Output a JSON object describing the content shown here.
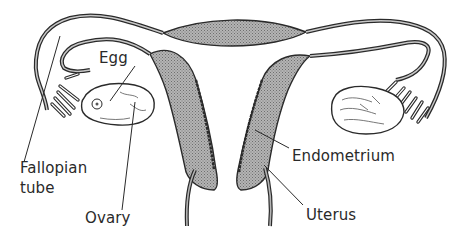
{
  "diagram": {
    "labels": {
      "egg": "Egg",
      "fallopian_tube_line1": "Fallopian",
      "fallopian_tube_line2": "tube",
      "ovary": "Ovary",
      "endometrium": "Endometrium",
      "uterus": "Uterus"
    },
    "colors": {
      "outline": "#2a2a2a",
      "shading": "#a8a8a8",
      "background": "#ffffff"
    }
  }
}
